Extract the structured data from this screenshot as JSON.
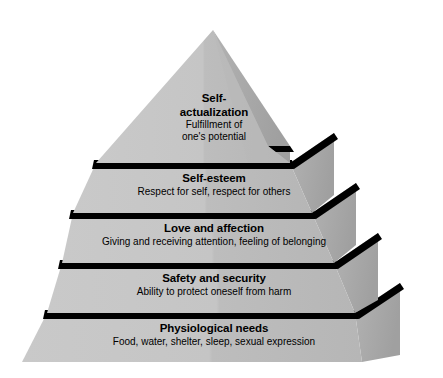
{
  "diagram": {
    "name": "Maslow's hierarchy of needs pyramid",
    "shape": "stepped 3d pyramid",
    "colors": {
      "front_face_light": "#c3c3c3",
      "front_face_shaded": "#b0b0b0",
      "side_depth_face": "#a8a8a8",
      "side_depth_face_dark": "#9a9a9a",
      "separator_bar": "#000000",
      "background": "#ffffff",
      "text": "#000000"
    },
    "tiers": [
      {
        "id": "self-actualization",
        "level": 5,
        "title": "Self-actualization",
        "title_line_1": "Self-",
        "title_line_2": "actualization",
        "description": "Fulfillment of one's potential",
        "desc_line_1": "Fulfillment of",
        "desc_line_2": "one's potential"
      },
      {
        "id": "self-esteem",
        "level": 4,
        "title": "Self-esteem",
        "description": "Respect for self, respect for others"
      },
      {
        "id": "love-and-affection",
        "level": 3,
        "title": "Love and affection",
        "description": "Giving and receiving attention, feeling of belonging"
      },
      {
        "id": "safety-and-security",
        "level": 2,
        "title": "Safety and security",
        "description": "Ability to protect oneself from harm"
      },
      {
        "id": "physiological-needs",
        "level": 1,
        "title": "Physiological needs",
        "description": "Food, water, shelter, sleep, sexual expression"
      }
    ]
  }
}
